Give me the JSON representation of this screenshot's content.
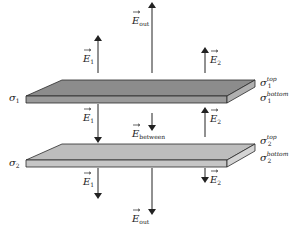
{
  "figure": {
    "colors": {
      "plate1_top": "#8c8c8c",
      "plate1_front": "#9a9a9a",
      "plate1_side": "#b0b0b0",
      "plate2_top": "#bdbdbd",
      "plate2_front": "#c6c6c6",
      "plate2_side": "#d4d4d4",
      "stroke": "#2a2a2a",
      "arrow": "#222222"
    }
  },
  "plates": [
    {
      "label": "σ",
      "label_sub": "1",
      "top_label": "σ",
      "top_label_sub": "1",
      "top_label_sup": "top",
      "bottom_label": "σ",
      "bottom_label_sub": "1",
      "bottom_label_sup": "bottom"
    },
    {
      "label": "σ",
      "label_sub": "2",
      "top_label": "σ",
      "top_label_sub": "2",
      "top_label_sup": "top",
      "bottom_label": "σ",
      "bottom_label_sub": "2",
      "bottom_label_sup": "bottom"
    }
  ],
  "fields": {
    "e1": {
      "symbol": "E",
      "sub": "1"
    },
    "e2": {
      "symbol": "E",
      "sub": "2"
    },
    "eout": {
      "symbol": "E",
      "sub": "out"
    },
    "ebetween": {
      "symbol": "E",
      "sub": "between"
    }
  },
  "arrows": [
    {
      "name": "e1-above",
      "direction": "up",
      "region": "above"
    },
    {
      "name": "eout-above",
      "direction": "up",
      "region": "above"
    },
    {
      "name": "e2-above",
      "direction": "up",
      "region": "above"
    },
    {
      "name": "e1-between",
      "direction": "down",
      "region": "between"
    },
    {
      "name": "ebetween",
      "direction": "down",
      "region": "between"
    },
    {
      "name": "e2-between",
      "direction": "up",
      "region": "between"
    },
    {
      "name": "e1-below",
      "direction": "down",
      "region": "below"
    },
    {
      "name": "eout-below",
      "direction": "down",
      "region": "below"
    },
    {
      "name": "e2-below",
      "direction": "down",
      "region": "below"
    }
  ]
}
